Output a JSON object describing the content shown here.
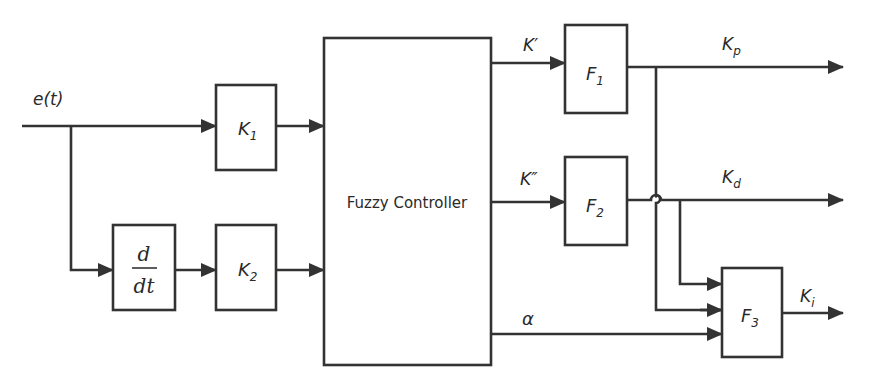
{
  "diagram": {
    "input_signal": {
      "label": "e(t)"
    },
    "blocks": {
      "k1": {
        "main": "K",
        "sub": "1"
      },
      "derivative": {
        "numerator": "d",
        "denominator": "dt"
      },
      "k2": {
        "main": "K",
        "sub": "2"
      },
      "fuzzy_controller": {
        "label": "Fuzzy Controller"
      },
      "f1": {
        "main": "F",
        "sub": "1"
      },
      "f2": {
        "main": "F",
        "sub": "2"
      },
      "f3": {
        "main": "F",
        "sub": "3"
      }
    },
    "signals": {
      "k_prime": "K′",
      "k_double_prime": "K″",
      "alpha": "α",
      "kp": {
        "main": "K",
        "sub": "p"
      },
      "kd": {
        "main": "K",
        "sub": "d"
      },
      "ki": {
        "main": "K",
        "sub": "i"
      }
    },
    "colors": {
      "line": "#333333",
      "background": "#ffffff",
      "text": "#2a2a2a"
    }
  }
}
